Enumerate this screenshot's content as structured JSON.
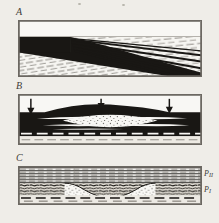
{
  "figure": {
    "background_color": "#f4f2ee",
    "ink_color": "#141210",
    "frame_color": "#6b6762",
    "panels": [
      {
        "id": "A",
        "letter": "A",
        "caption": "",
        "description": "Massive black bed at left splitting rightward into several downward-dipping black seams over a dashed-stippled host rock",
        "x": 18,
        "y": 20,
        "width": 184,
        "height": 57
      },
      {
        "id": "B",
        "letter": "B",
        "caption": "",
        "description": "Black bed arched into a low dome by three downward-directed loads; a white stippled lens occupies its core",
        "x": 18,
        "y": 94,
        "width": 184,
        "height": 51,
        "arrows": [
          {
            "name": "load-arrow-left",
            "x": 30,
            "label": ""
          },
          {
            "name": "load-arrow-center",
            "x": 101,
            "label": ""
          },
          {
            "name": "load-arrow-right",
            "x": 170,
            "label": ""
          }
        ],
        "arrow_count": 3,
        "arrow_direction": "down"
      },
      {
        "id": "C",
        "letter": "C",
        "caption": "",
        "description": "Horizontally bedded upper unit over a dark brecciated layer enclosing a bowl-shaped white stippled trough",
        "x": 18,
        "y": 166,
        "width": 184,
        "height": 39,
        "labels": [
          {
            "name": "stratum-label-upper",
            "text": "P",
            "subscript": "II",
            "x": 205,
            "y": 172
          },
          {
            "name": "stratum-label-lower",
            "text": "P",
            "subscript": "I",
            "x": 205,
            "y": 188
          }
        ]
      }
    ],
    "letters": {
      "a": {
        "text": "A",
        "x": 16,
        "y": 7
      },
      "b": {
        "text": "B",
        "x": 16,
        "y": 81
      },
      "c": {
        "text": "C",
        "x": 16,
        "y": 153
      }
    }
  }
}
